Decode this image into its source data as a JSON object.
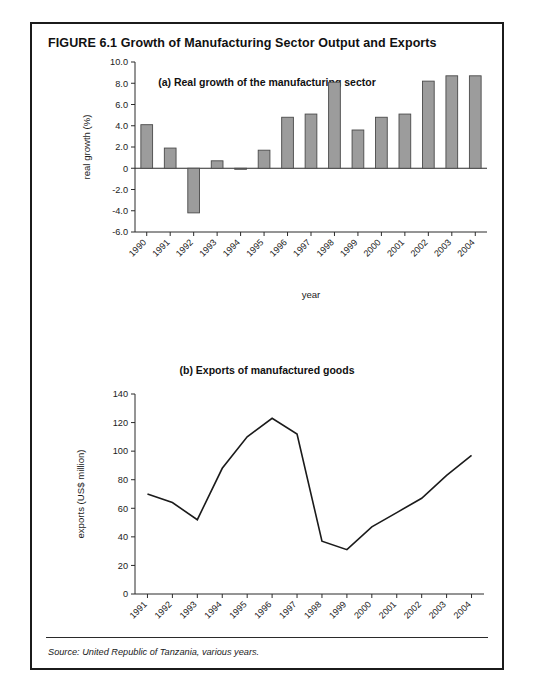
{
  "figure": {
    "number_and_title": "FIGURE 6.1  Growth of Manufacturing Sector Output and Exports",
    "source": "Source: United Republic of Tanzania, various years."
  },
  "panel_a": {
    "title": "(a) Real growth of the manufacturing sector"
  },
  "panel_b": {
    "title": "(b) Exports of manufactured goods"
  },
  "chart_data": [
    {
      "type": "bar",
      "title": "(a) Real growth of the manufacturing sector",
      "xlabel": "year",
      "ylabel": "real growth (%)",
      "categories": [
        "1990",
        "1991",
        "1992",
        "1993",
        "1994",
        "1995",
        "1996",
        "1997",
        "1998",
        "1999",
        "2000",
        "2001",
        "2002",
        "2003",
        "2004"
      ],
      "values": [
        4.1,
        1.9,
        -4.2,
        0.7,
        -0.1,
        1.7,
        4.8,
        5.1,
        8.1,
        3.6,
        4.8,
        5.1,
        8.2,
        8.7,
        8.7
      ],
      "ylim": [
        -6.0,
        10.0
      ],
      "ytick_labels": [
        "10.0",
        "8.0",
        "6.0",
        "4.0",
        "2.0",
        "0",
        "-2.0",
        "-4.0",
        "-6.0"
      ],
      "ytick_values": [
        10.0,
        8.0,
        6.0,
        4.0,
        2.0,
        0,
        -2.0,
        -4.0,
        -6.0
      ],
      "grid": false,
      "legend": "none",
      "bar_color": "#9c9c9c",
      "bar_edge_color": "#4a4a4a"
    },
    {
      "type": "line",
      "title": "(b) Exports of manufactured goods",
      "xlabel": "year",
      "ylabel": "exports (US$ million)",
      "categories": [
        "1991",
        "1992",
        "1993",
        "1994",
        "1995",
        "1996",
        "1997",
        "1998",
        "1999",
        "2000",
        "2001",
        "2002",
        "2003",
        "2004"
      ],
      "values": [
        70,
        64,
        52,
        88,
        110,
        123,
        112,
        37,
        31,
        47,
        57,
        67,
        83,
        97
      ],
      "ylim": [
        0,
        140
      ],
      "ytick_labels": [
        "140",
        "120",
        "100",
        "80",
        "60",
        "40",
        "20",
        "0"
      ],
      "ytick_values": [
        140,
        120,
        100,
        80,
        60,
        40,
        20,
        0
      ],
      "grid": false,
      "legend": "none",
      "line_color": "#1b1b1b"
    }
  ]
}
